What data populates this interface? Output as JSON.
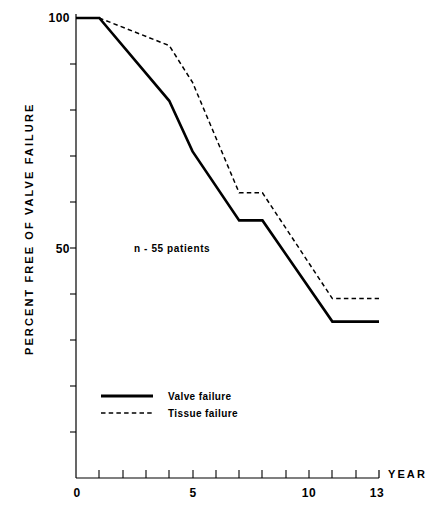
{
  "chart_data": {
    "type": "line",
    "title": "",
    "xlabel": "YEAR",
    "ylabel": "PERCENT FREE OF VALVE FAILURE",
    "xlim": [
      0,
      13
    ],
    "ylim": [
      0,
      100
    ],
    "xticks": [
      0,
      1,
      2,
      3,
      4,
      5,
      6,
      7,
      8,
      9,
      10,
      11,
      12,
      13
    ],
    "xtick_labels": [
      "0",
      "",
      "",
      "",
      "",
      "5",
      "",
      "",
      "",
      "",
      "10",
      "",
      "",
      "13"
    ],
    "yticks": [
      100,
      90,
      80,
      70,
      60,
      50,
      40,
      30,
      20,
      10
    ],
    "ytick_labels": [
      "100",
      "",
      "",
      "",
      "",
      "50",
      "",
      "",
      "",
      ""
    ],
    "grid": false,
    "legend_position": "lower-left-inside",
    "annotations": [
      {
        "text": "n - 55 patients",
        "x": 3.0,
        "y": 50
      }
    ],
    "series": [
      {
        "name": "Valve failure",
        "style": "solid",
        "x": [
          0,
          1,
          4,
          5,
          7,
          8,
          11,
          13
        ],
        "values": [
          100,
          100,
          82,
          71,
          56,
          56,
          34,
          34
        ]
      },
      {
        "name": "Tissue failure",
        "style": "dashed",
        "x": [
          0,
          1,
          4,
          5,
          7,
          8,
          11,
          13
        ],
        "values": [
          100,
          100,
          94,
          86,
          62,
          62,
          39,
          39
        ]
      }
    ]
  },
  "axes": {
    "y_label": "PERCENT FREE OF VALVE FAILURE",
    "y_top_label": "100",
    "y_mid_label": "50",
    "x_axis_name": "YEAR",
    "x_label_0": "0",
    "x_label_5": "5",
    "x_label_10": "10",
    "x_label_13": "13"
  },
  "annotation": {
    "sample_size": "n - 55 patients"
  },
  "legend": {
    "items": [
      {
        "label": "Valve failure",
        "style": "solid"
      },
      {
        "label": "Tissue failure",
        "style": "dashed"
      }
    ]
  },
  "colors": {
    "ink": "#000000",
    "background": "#ffffff"
  }
}
